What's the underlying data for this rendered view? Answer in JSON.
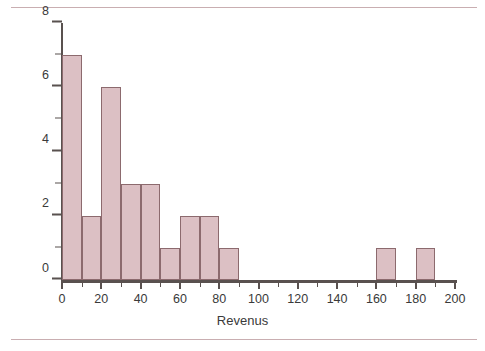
{
  "chart_data": {
    "type": "bar",
    "title": "",
    "subtitle": "",
    "xlabel": "Revenus",
    "ylabel": "Effectif",
    "xlim": [
      0,
      200
    ],
    "ylim": [
      0,
      8
    ],
    "bin_width": 10,
    "grid": false,
    "legend": null,
    "bar_color": "#dcc0c4",
    "bar_edge_color": "#8c6a6e",
    "axis_color": "#59514f",
    "rule_color": "#c9aeb1",
    "background": "#ffffff",
    "x_ticks_major": [
      0,
      20,
      40,
      60,
      80,
      100,
      120,
      140,
      160,
      180,
      200
    ],
    "x_ticks_minor": [
      10,
      30,
      50,
      70,
      90,
      110,
      130,
      150,
      170,
      190
    ],
    "y_ticks_major": [
      0,
      2,
      4,
      6,
      8
    ],
    "y_ticks_minor": [
      1,
      3,
      5,
      7
    ],
    "x_tick_labels": [
      "0",
      "20",
      "40",
      "60",
      "80",
      "100",
      "120",
      "140",
      "160",
      "180",
      "200"
    ],
    "y_tick_labels": [
      "0",
      "2",
      "4",
      "6",
      "8"
    ],
    "bins": [
      {
        "start": 0,
        "end": 10,
        "value": 7
      },
      {
        "start": 10,
        "end": 20,
        "value": 2
      },
      {
        "start": 20,
        "end": 30,
        "value": 6
      },
      {
        "start": 30,
        "end": 40,
        "value": 3
      },
      {
        "start": 40,
        "end": 50,
        "value": 3
      },
      {
        "start": 50,
        "end": 60,
        "value": 1
      },
      {
        "start": 60,
        "end": 70,
        "value": 2
      },
      {
        "start": 70,
        "end": 80,
        "value": 2
      },
      {
        "start": 80,
        "end": 90,
        "value": 1
      },
      {
        "start": 90,
        "end": 100,
        "value": 0
      },
      {
        "start": 100,
        "end": 110,
        "value": 0
      },
      {
        "start": 110,
        "end": 120,
        "value": 0
      },
      {
        "start": 120,
        "end": 130,
        "value": 0
      },
      {
        "start": 130,
        "end": 140,
        "value": 0
      },
      {
        "start": 140,
        "end": 150,
        "value": 0
      },
      {
        "start": 150,
        "end": 160,
        "value": 0
      },
      {
        "start": 160,
        "end": 170,
        "value": 1
      },
      {
        "start": 170,
        "end": 180,
        "value": 0
      },
      {
        "start": 180,
        "end": 190,
        "value": 1
      },
      {
        "start": 190,
        "end": 200,
        "value": 0
      }
    ],
    "categories": [
      "0-10",
      "10-20",
      "20-30",
      "30-40",
      "40-50",
      "50-60",
      "60-70",
      "70-80",
      "80-90",
      "90-100",
      "100-110",
      "110-120",
      "120-130",
      "130-140",
      "140-150",
      "150-160",
      "160-170",
      "170-180",
      "180-190",
      "190-200"
    ],
    "values": [
      7,
      2,
      6,
      3,
      3,
      1,
      2,
      2,
      1,
      0,
      0,
      0,
      0,
      0,
      0,
      0,
      1,
      0,
      1,
      0
    ]
  }
}
